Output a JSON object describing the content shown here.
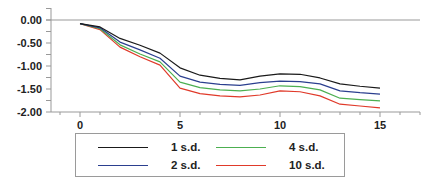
{
  "chart_data": {
    "type": "line",
    "title": "",
    "xlabel": "",
    "ylabel": "",
    "x": [
      0,
      1,
      2,
      3,
      4,
      5,
      6,
      7,
      8,
      9,
      10,
      11,
      12,
      13,
      14,
      15
    ],
    "xlim": [
      -1.5,
      17
    ],
    "ylim": [
      -2.0,
      0.25
    ],
    "x_ticks": [
      0,
      5,
      10,
      15
    ],
    "x_tick_labels": [
      "0",
      "5",
      "10",
      "15"
    ],
    "y_ticks": [
      0.0,
      -0.5,
      -1.0,
      -1.5,
      -2.0
    ],
    "y_tick_labels": [
      "0.00",
      "-0.50",
      "-1.00",
      "-1.50",
      "-2.00"
    ],
    "grid": false,
    "legend_position": "bottom",
    "series": [
      {
        "name": "1 s.d.",
        "color": "#1a1a1a",
        "values": [
          -0.08,
          -0.15,
          -0.4,
          -0.55,
          -0.72,
          -1.04,
          -1.2,
          -1.27,
          -1.3,
          -1.22,
          -1.17,
          -1.18,
          -1.26,
          -1.39,
          -1.44,
          -1.48
        ]
      },
      {
        "name": "2 s.d.",
        "color": "#2b3f8f",
        "values": [
          -0.08,
          -0.17,
          -0.48,
          -0.65,
          -0.83,
          -1.22,
          -1.35,
          -1.4,
          -1.42,
          -1.36,
          -1.33,
          -1.34,
          -1.39,
          -1.54,
          -1.58,
          -1.61
        ]
      },
      {
        "name": "4 s.d.",
        "color": "#4caf50",
        "values": [
          -0.08,
          -0.19,
          -0.54,
          -0.74,
          -0.91,
          -1.35,
          -1.47,
          -1.52,
          -1.54,
          -1.5,
          -1.43,
          -1.45,
          -1.52,
          -1.7,
          -1.73,
          -1.76
        ]
      },
      {
        "name": "10 s.d.",
        "color": "#e03a2a",
        "values": [
          -0.08,
          -0.21,
          -0.59,
          -0.8,
          -0.98,
          -1.48,
          -1.6,
          -1.65,
          -1.67,
          -1.63,
          -1.54,
          -1.56,
          -1.65,
          -1.83,
          -1.87,
          -1.91
        ]
      }
    ]
  },
  "legend": {
    "items": [
      {
        "label": "1 s.d.",
        "color": "#1a1a1a"
      },
      {
        "label": "2 s.d.",
        "color": "#2b3f8f"
      },
      {
        "label": "4 s.d.",
        "color": "#4caf50"
      },
      {
        "label": "10 s.d.",
        "color": "#e03a2a"
      }
    ]
  }
}
